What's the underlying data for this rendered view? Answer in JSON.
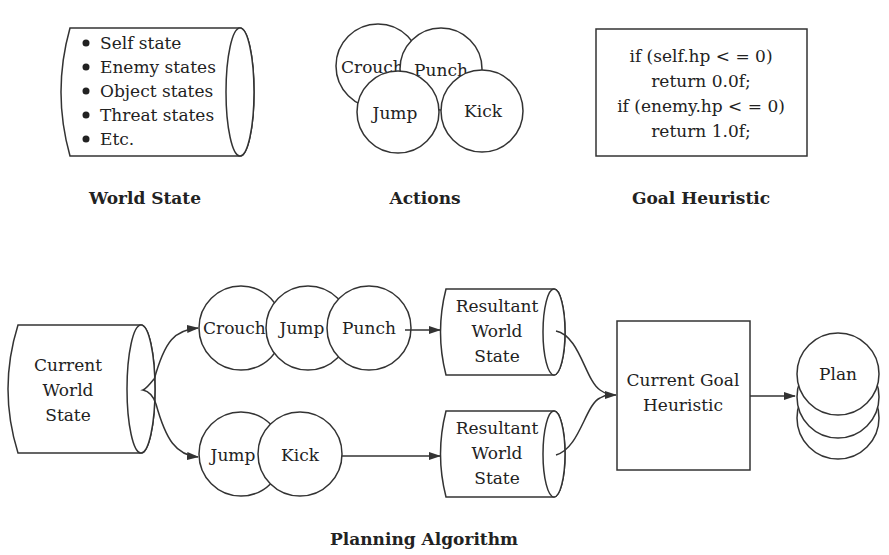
{
  "top": {
    "world_state": {
      "items": [
        "Self state",
        "Enemy states",
        "Object states",
        "Threat states",
        "Etc."
      ],
      "caption": "World State"
    },
    "actions": {
      "circles": [
        "Crouch",
        "Punch",
        "Jump",
        "Kick"
      ],
      "caption": "Actions"
    },
    "goal_heuristic": {
      "code_lines": [
        "if (self.hp < = 0)",
        "return 0.0f;",
        "if (enemy.hp < = 0)",
        "return 1.0f;"
      ],
      "caption": "Goal Heuristic"
    }
  },
  "planning": {
    "current_world_state": [
      "Current",
      "World",
      "State"
    ],
    "branch_top": [
      "Crouch",
      "Jump",
      "Punch"
    ],
    "branch_bottom": [
      "Jump",
      "Kick"
    ],
    "resultant_top": [
      "Resultant",
      "World",
      "State"
    ],
    "resultant_bottom": [
      "Resultant",
      "World",
      "State"
    ],
    "goal_box": [
      "Current Goal",
      "Heuristic"
    ],
    "plan": "Plan",
    "caption": "Planning Algorithm"
  }
}
